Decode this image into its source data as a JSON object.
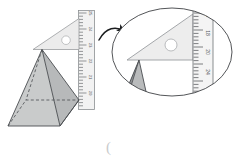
{
  "figure": {
    "background_color": "#ffffff"
  },
  "main_view": {
    "name": "main-illustration",
    "pyramid": {
      "label": "square-pyramid",
      "face_front_color": "#c9cbcb",
      "face_right_color": "#b7b9ba",
      "edge_color": "#4a4d50",
      "hidden_edge_style": "dashed"
    },
    "set_square": {
      "label": "set-square",
      "fill_color": "#ececec",
      "edge_color": "#9a9da0",
      "hole_color": "#ffffff",
      "hole_edge_color": "#a9acae"
    },
    "ruler": {
      "label": "vertical-ruler",
      "fill_color": "#f2f2f2",
      "edge_color": "#8c8f92",
      "tick_color": "#6b6e71",
      "numbers": [
        "25",
        "24",
        "23",
        "22",
        "21",
        "20"
      ],
      "units": "cm"
    }
  },
  "callout": {
    "name": "magnifier-callout",
    "ellipse_edge_color": "#3f4245",
    "arrow_color": "#1b1d1f",
    "arrow_direction": "right",
    "ruler": {
      "label": "magnified-ruler",
      "fill_color": "#f4f4f4",
      "edge_color": "#7d8083",
      "tick_color": "#5d6063",
      "numbers": [
        "15",
        "18",
        "20",
        "24"
      ]
    },
    "set_square": {
      "label": "magnified-set-square",
      "fill_color": "#ededed",
      "edge_color": "#9a9da0",
      "hole_color": "#ffffff"
    },
    "pyramid": {
      "label": "magnified-pyramid-apex",
      "face_front_color": "#b9bbbc",
      "face_left_color": "#8f9294",
      "edge_color": "#4a4d50"
    }
  },
  "annotation": {
    "bottom_mark": "(",
    "bottom_mark_color": "#c9cbcc"
  }
}
